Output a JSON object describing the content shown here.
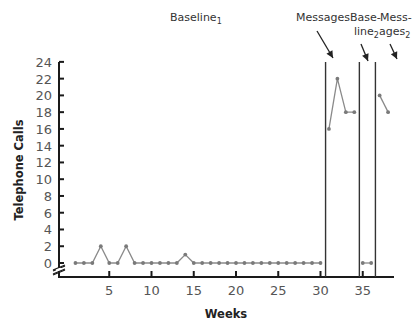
{
  "chart_data": {
    "type": "line",
    "title": "",
    "xlabel": "Weeks",
    "ylabel": "Telephone Calls",
    "xlim": [
      0,
      39
    ],
    "ylim": [
      0,
      24
    ],
    "x_ticks": [
      5,
      10,
      15,
      20,
      25,
      30,
      35
    ],
    "y_ticks": [
      0,
      2,
      4,
      6,
      8,
      10,
      12,
      14,
      16,
      18,
      20,
      22,
      24
    ],
    "grid": false,
    "axis_break": true,
    "phases": [
      {
        "name": "Baseline1",
        "label": "Baseline",
        "subscript": "1",
        "weeks": [
          1,
          30
        ]
      },
      {
        "name": "Messages",
        "label": "Messages",
        "subscript": "",
        "weeks": [
          31,
          34
        ]
      },
      {
        "name": "Baseline2",
        "label": "Base-line",
        "subscript": "2",
        "weeks": [
          35,
          36
        ]
      },
      {
        "name": "Messages2",
        "label": "Mess-ages",
        "subscript": "2",
        "weeks": [
          37,
          38
        ]
      }
    ],
    "phase_change_lines_at_week": [
      30.6,
      34.6,
      36.5
    ],
    "series": [
      {
        "name": "Baseline1",
        "x": [
          1,
          2,
          3,
          4,
          5,
          6,
          7,
          8,
          9,
          10,
          11,
          12,
          13,
          14,
          15,
          16,
          17,
          18,
          19,
          20,
          21,
          22,
          23,
          24,
          25,
          26,
          27,
          28,
          29,
          30
        ],
        "values": [
          0,
          0,
          0,
          2,
          0,
          0,
          2,
          0,
          0,
          0,
          0,
          0,
          0,
          1,
          0,
          0,
          0,
          0,
          0,
          0,
          0,
          0,
          0,
          0,
          0,
          0,
          0,
          0,
          0,
          0
        ]
      },
      {
        "name": "Messages",
        "x": [
          31,
          32,
          33,
          34
        ],
        "values": [
          16,
          22,
          18,
          18
        ]
      },
      {
        "name": "Baseline2",
        "x": [
          35,
          36
        ],
        "values": [
          0,
          0
        ]
      },
      {
        "name": "Messages2",
        "x": [
          37,
          38
        ],
        "values": [
          20,
          18
        ]
      }
    ]
  },
  "labels": {
    "ylabel": "Telephone Calls",
    "xlabel": "Weeks",
    "baseline1": "Baseline",
    "baseline1_sub": "1",
    "messages": "Messages",
    "baseline2_l1": "Base-",
    "baseline2_l2": "line",
    "baseline2_sub": "2",
    "messages2_l1": "Mess-",
    "messages2_l2": "ages",
    "messages2_sub": "2"
  },
  "colors": {
    "axis": "#1a1a1a",
    "data_line": "#8a8a8a",
    "marker": "#7a7a7a",
    "phase_line": "#333333"
  }
}
